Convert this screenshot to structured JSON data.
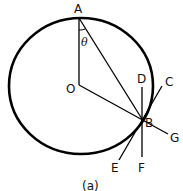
{
  "figure": {
    "caption": "(a)",
    "points": {
      "A": "A",
      "O": "O",
      "B": "B",
      "C": "C",
      "D": "D",
      "E": "E",
      "F": "F",
      "G": "G"
    },
    "angle_label": "θ"
  }
}
